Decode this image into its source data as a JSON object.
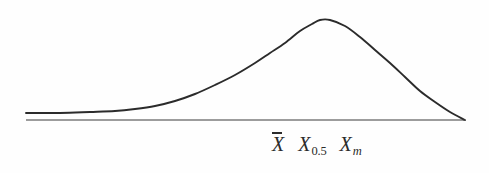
{
  "figure": {
    "title": "",
    "background_color": "#fefefe",
    "ink_color": "#2b2b2b"
  },
  "axis": {
    "name": "horizontal-baseline",
    "x_start": 26,
    "x_end": 465,
    "y": 120,
    "stroke_width": 1.1
  },
  "labels": {
    "mean": {
      "base": "X",
      "accent": "overbar",
      "text": "X̄",
      "meaning": "arithmetic-mean"
    },
    "median": {
      "base": "X",
      "subscript": "0.5",
      "text": "X0.5",
      "meaning": "median"
    },
    "mode": {
      "base": "X",
      "subscript": "m",
      "text": "Xm",
      "meaning": "mode"
    }
  },
  "chart_data": {
    "type": "line",
    "title": "",
    "subtitle": "",
    "xlabel": "",
    "ylabel": "",
    "grid": false,
    "legend": null,
    "annotations": [
      {
        "label": "X̄",
        "x": 285,
        "role": "mean"
      },
      {
        "label": "X0.5",
        "x": 323,
        "role": "median"
      },
      {
        "label": "Xm",
        "x": 368,
        "role": "mode"
      }
    ],
    "xlim": [
      26,
      465
    ],
    "ylim": [
      0,
      100
    ],
    "baseline_y_px": 120,
    "peak": {
      "x_px": 320,
      "y_px": 20
    },
    "series": [
      {
        "name": "frequency-curve",
        "points_px": [
          [
            26,
            113
          ],
          [
            60,
            113
          ],
          [
            90,
            112
          ],
          [
            115,
            111
          ],
          [
            135,
            109
          ],
          [
            155,
            106
          ],
          [
            175,
            101
          ],
          [
            195,
            94
          ],
          [
            215,
            85
          ],
          [
            235,
            75
          ],
          [
            255,
            63
          ],
          [
            270,
            53
          ],
          [
            285,
            43
          ],
          [
            300,
            31
          ],
          [
            312,
            24
          ],
          [
            320,
            20
          ],
          [
            330,
            20
          ],
          [
            345,
            26
          ],
          [
            360,
            37
          ],
          [
            375,
            50
          ],
          [
            390,
            63
          ],
          [
            405,
            77
          ],
          [
            420,
            91
          ],
          [
            435,
            102
          ],
          [
            450,
            112
          ],
          [
            465,
            120
          ]
        ]
      }
    ]
  }
}
